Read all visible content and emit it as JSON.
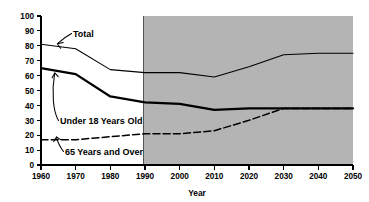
{
  "chart_data": {
    "type": "line",
    "title": "",
    "xlabel": "Year",
    "ylabel": "",
    "xlim": [
      1960,
      2050
    ],
    "ylim": [
      0,
      100
    ],
    "grid": false,
    "legend_position": "inline-annotations",
    "x": [
      1960,
      1970,
      1980,
      1990,
      2000,
      2010,
      2020,
      2030,
      2040,
      2050
    ],
    "xticks": [
      "1960",
      "1970",
      "1980",
      "1990",
      "2000",
      "2010",
      "2020",
      "2030",
      "2040",
      "2050"
    ],
    "yticks": [
      "0",
      "10",
      "20",
      "30",
      "40",
      "50",
      "60",
      "70",
      "80",
      "90",
      "100"
    ],
    "series": [
      {
        "name": "Total",
        "style": "thin-solid",
        "values": [
          81,
          78,
          64,
          62,
          62,
          59,
          66,
          74,
          75,
          75
        ]
      },
      {
        "name": "Under 18 Years Old",
        "style": "thick-solid",
        "values": [
          65,
          61,
          46,
          42,
          41,
          37,
          38,
          38,
          38,
          38
        ]
      },
      {
        "name": "65 Years and Over",
        "style": "dashed",
        "values": [
          17,
          17,
          19,
          21,
          21,
          23,
          30,
          38,
          38,
          38
        ]
      }
    ],
    "annotations": [
      {
        "name": "projection-band",
        "label": "",
        "x_start": 1990,
        "x_end": 2050
      }
    ]
  },
  "labels": {
    "total": "Total",
    "under18": "Under 18 Years Old",
    "over65": "65 Years and Over",
    "xaxis": "Year"
  }
}
